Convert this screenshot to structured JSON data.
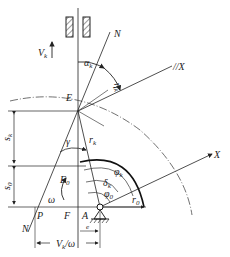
{
  "diagram": {
    "type": "cam-follower kinematic diagram (flat-faced follower, offset)",
    "line_color": "#2a2a2a",
    "labels": {
      "V_k": "V",
      "V_k_sub": "k",
      "N_top": "N",
      "alpha_k": "α",
      "alpha_k_sub": "k",
      "eta_k": "η",
      "eta_k_sub": "k",
      "parallel_X": "//X",
      "E": "E",
      "s_k": "s",
      "s_k_sub": "k",
      "s_0": "s",
      "s_0_sub": "0",
      "gamma": "γ",
      "r_k": "r",
      "r_k_sub": "k",
      "phi_k": "φ",
      "phi_k_sub": "k",
      "delta_k": "δ",
      "delta_k_sub": "k",
      "phi_0": "φ",
      "phi_0_sub": "0",
      "X": "X",
      "E_0": "E",
      "E_0_sub": "0",
      "omega": "ω",
      "N_bottom": "N",
      "P": "P",
      "F": "F",
      "A": "A",
      "e": "e",
      "r_0": "r",
      "r_0_sub": "0",
      "bottom_dim": "V",
      "bottom_dim_sub": "k",
      "bottom_dim_tail": "/ω"
    }
  }
}
